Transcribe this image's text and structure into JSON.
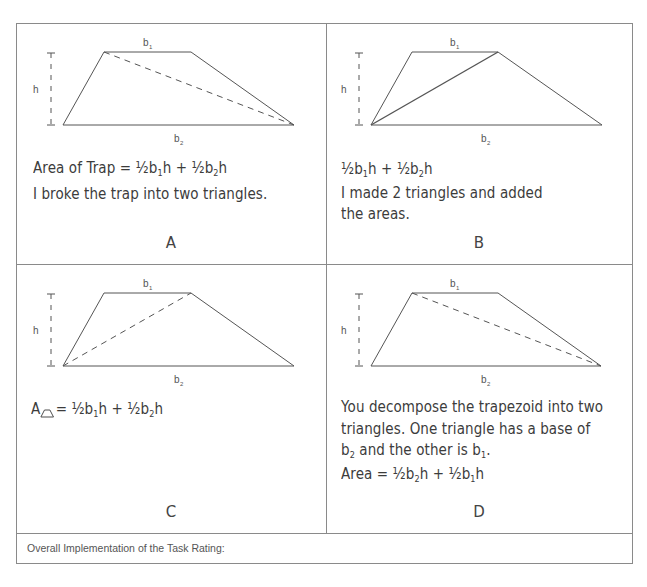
{
  "diagram_labels": {
    "top_base": "b",
    "top_sub": "1",
    "bottom_base": "b",
    "bottom_sub": "2",
    "height": "h"
  },
  "cells": [
    {
      "letter": "A",
      "diagonal": "dashed top-left to bottom-right",
      "lines": [
        {
          "parts": [
            "Area of Trap = ½b",
            "1",
            "h + ½b",
            "2",
            "h"
          ]
        },
        {
          "text": "I broke the trap into two triangles."
        }
      ]
    },
    {
      "letter": "B",
      "diagonal": "solid bottom-left to top-right",
      "lines": [
        {
          "parts": [
            "½b",
            "1",
            "h + ½b",
            "2",
            "h"
          ]
        },
        {
          "text": "I made 2 triangles and added"
        },
        {
          "text": "the areas."
        }
      ]
    },
    {
      "letter": "C",
      "diagonal": "dashed bottom-left to top-right",
      "lines": [
        {
          "parts": [
            "A",
            "= ½b",
            "1",
            "h + ½b",
            "2",
            "h"
          ]
        }
      ]
    },
    {
      "letter": "D",
      "diagonal": "dashed top-left to bottom-right",
      "lines": [
        {
          "text": "You decompose the trapezoid into two"
        },
        {
          "text": "triangles. One triangle has a base of"
        },
        {
          "parts": [
            "b",
            "2",
            " and the other is b",
            "1",
            "."
          ]
        },
        {
          "parts": [
            "Area = ½b",
            "2",
            "h + ½b",
            "1",
            "h"
          ]
        }
      ]
    }
  ],
  "footer": {
    "label": "Overall Implementation of the Task Rating:"
  },
  "colors": {
    "border": "#8a8a8a",
    "ink": "#3c3c3c",
    "line": "#555555"
  }
}
